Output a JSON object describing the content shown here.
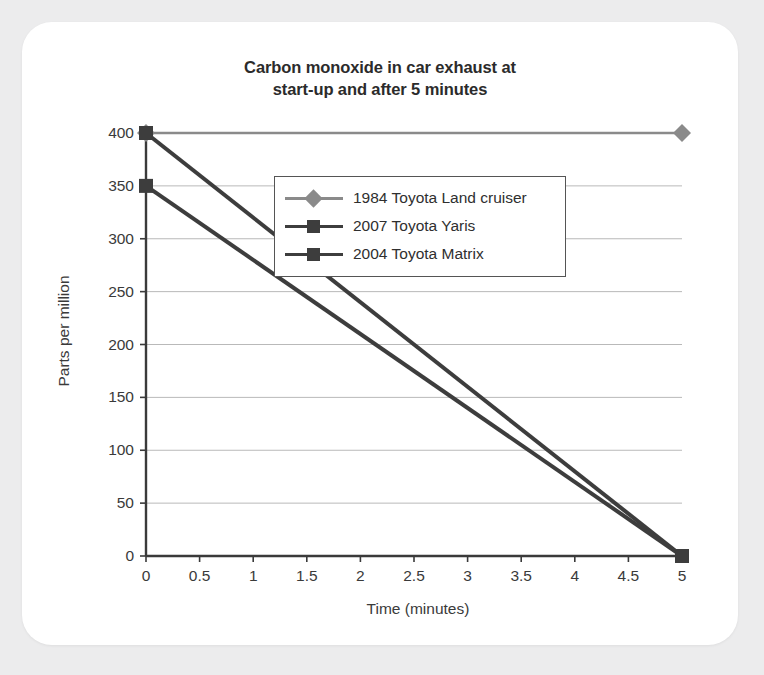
{
  "card": {
    "background_color": "#ffffff",
    "page_background_color": "#ececed"
  },
  "chart_data": {
    "type": "line",
    "title": "Carbon monoxide in car exhaust at start-up and after 5 minutes",
    "title_line1": "Carbon monoxide in car exhaust at",
    "title_line2": "start-up and after 5 minutes",
    "xlabel": "Time (minutes)",
    "ylabel": "Parts per million",
    "xlim": [
      0,
      5
    ],
    "ylim": [
      0,
      400
    ],
    "xticks": [
      "0",
      "0.5",
      "1",
      "1.5",
      "2",
      "2.5",
      "3",
      "3.5",
      "4",
      "4.5",
      "5"
    ],
    "xtick_values": [
      0,
      0.5,
      1,
      1.5,
      2,
      2.5,
      3,
      3.5,
      4,
      4.5,
      5
    ],
    "yticks": [
      "0",
      "50",
      "100",
      "150",
      "200",
      "250",
      "300",
      "350",
      "400"
    ],
    "ytick_values": [
      0,
      50,
      100,
      150,
      200,
      250,
      300,
      350,
      400
    ],
    "grid": "horizontal",
    "legend_position": "upper-right-inside",
    "x": [
      0,
      5
    ],
    "series": [
      {
        "name": "1984 Toyota Land cruiser",
        "marker": "diamond",
        "color": "#8a8a8a",
        "values": [
          400,
          400
        ]
      },
      {
        "name": "2007 Toyota Yaris",
        "marker": "square",
        "color": "#3d3d3d",
        "values": [
          400,
          0
        ]
      },
      {
        "name": "2004 Toyota Matrix",
        "marker": "square",
        "color": "#3d3d3d",
        "values": [
          350,
          0
        ]
      }
    ]
  }
}
